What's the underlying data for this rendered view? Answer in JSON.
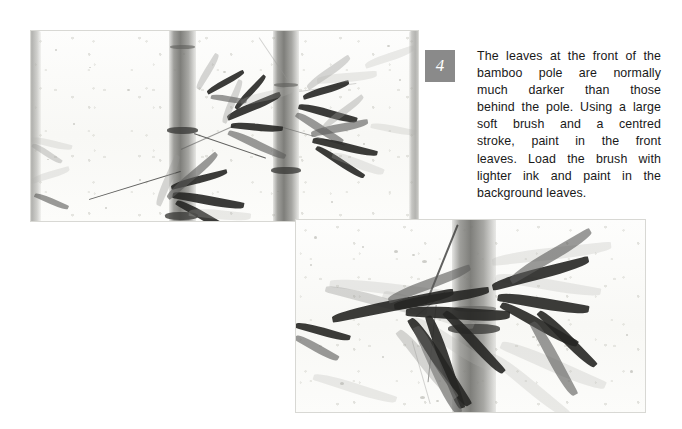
{
  "page": {
    "background_color": "#ffffff",
    "width": 682,
    "height": 429
  },
  "step": {
    "number": "4",
    "badge_color": "#8a8a8a",
    "badge_text_color": "#ffffff"
  },
  "caption": {
    "text": "The leaves at the front of the bamboo pole are normally much darker than those behind the pole. Using a large soft brush and a centred stroke, paint in the front leaves. Load the brush with lighter ink and paint in the background leaves.",
    "color": "#191919",
    "lines": [
      "The leaves at the front of the",
      "bamboo pole are normally",
      "much darker than those",
      "behind the pole. Using a large",
      "soft brush and a centred",
      "stroke, paint in the front",
      "leaves. Load the brush with",
      "lighter ink and paint in the",
      "background leaves."
    ],
    "words": {
      "l1": [
        "The",
        "leaves",
        "at",
        "the",
        "front",
        "of",
        "the"
      ],
      "l2": [
        "bamboo",
        "pole",
        "are",
        "normally"
      ],
      "l3": [
        "much",
        "darker",
        "than",
        "those"
      ],
      "l4": [
        "behind",
        "the",
        "pole.",
        "Using",
        "a",
        "large"
      ],
      "l5": [
        "soft",
        "brush",
        "and",
        "a",
        "centred"
      ],
      "l6": [
        "stroke,",
        "paint",
        "in",
        "the",
        "front"
      ],
      "l7": [
        "leaves.",
        "Load",
        "the",
        "brush",
        "with"
      ],
      "l8": [
        "lighter",
        "ink",
        "and",
        "paint",
        "in",
        "the"
      ],
      "l9": [
        "background  leaves."
      ]
    }
  },
  "figures": [
    {
      "id": "plate-1",
      "name": "bamboo-painting-wide",
      "alt": "Chinese ink painting of two pale bamboo poles with dark bamboo leaves on textured paper",
      "x": 30,
      "y": 30,
      "width": 389,
      "height": 192,
      "border_color": "#d8d8d4",
      "paper_color": "#fbfbf9",
      "ink_dark": "#262624",
      "ink_mid": "#5c5c5a",
      "ink_pale": "#969693"
    },
    {
      "id": "plate-2",
      "name": "bamboo-painting-detail",
      "alt": "Close-up ink painting detail of dark front leaves and a single bamboo pole with paler background leaves",
      "x": 295,
      "y": 219,
      "width": 351,
      "height": 194,
      "border_color": "#d8d8d4",
      "paper_color": "#fbfbf9",
      "ink_dark": "#262624",
      "ink_mid": "#5c5c5a",
      "ink_pale": "#969693"
    }
  ]
}
